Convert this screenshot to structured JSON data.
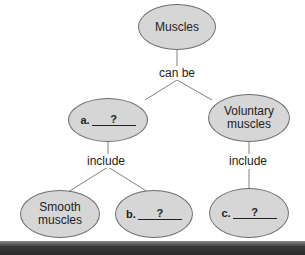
{
  "diagram": {
    "nodes": {
      "root": "Muscles",
      "a": {
        "letter": "a.",
        "blank": "?"
      },
      "voluntary": "Voluntary muscles",
      "smooth": "Smooth muscles",
      "b": {
        "letter": "b.",
        "blank": "?"
      },
      "c": {
        "letter": "c.",
        "blank": "?"
      }
    },
    "links": {
      "can_be": "can be",
      "include_left": "include",
      "include_right": "include"
    },
    "colors": {
      "node_fill": "#d6d6d6",
      "node_border": "#6e6e6e",
      "line": "#808080"
    }
  }
}
